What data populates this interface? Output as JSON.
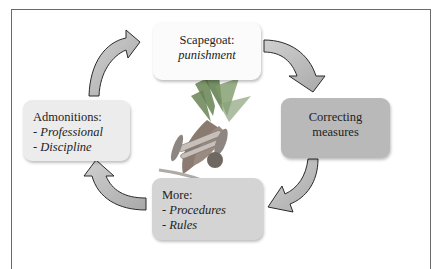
{
  "diagram": {
    "type": "cycle",
    "nodes": [
      {
        "id": "scapegoat",
        "title": "Scapegoat:",
        "subtitle": "punishment",
        "fill": "#fbfbfb"
      },
      {
        "id": "correcting",
        "title": "Correcting",
        "title2": "measures",
        "fill": "#b9b9b9"
      },
      {
        "id": "more",
        "title": "More:",
        "items": [
          "- Procedures",
          "- Rules"
        ],
        "fill": "#d4d4d4"
      },
      {
        "id": "admonitions",
        "title": "Admonitions:",
        "items": [
          "- Professional",
          "- Discipline"
        ],
        "fill": "#ececec"
      }
    ],
    "edges": [
      {
        "from": "scapegoat",
        "to": "correcting"
      },
      {
        "from": "correcting",
        "to": "more"
      },
      {
        "from": "more",
        "to": "admonitions"
      },
      {
        "from": "admonitions",
        "to": "scapegoat"
      }
    ],
    "arrow_fill": "#bdbdbd",
    "arrow_stroke": "#2a2a2a",
    "center_image": "carrot-bundle-illustration"
  }
}
